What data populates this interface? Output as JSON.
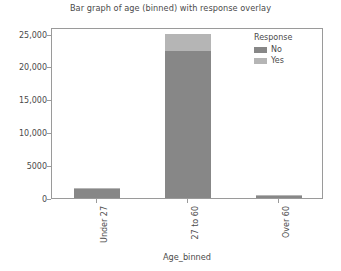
{
  "chart_data": {
    "type": "bar",
    "title": "Bar graph of age (binned) with response overlay",
    "xlabel": "Age_binned",
    "ylabel": "",
    "categories": [
      "Under 27",
      "27 to 60",
      "Over 60"
    ],
    "series": [
      {
        "name": "No",
        "color": "#878787",
        "values": [
          1400,
          22400,
          450
        ]
      },
      {
        "name": "Yes",
        "color": "#b5b5b5",
        "values": [
          150,
          2600,
          50
        ]
      }
    ],
    "stacked": true,
    "totals": [
      1550,
      25000,
      500
    ],
    "ylim": [
      0,
      26000
    ],
    "yticks": [
      0,
      5000,
      10000,
      15000,
      20000,
      25000
    ],
    "ytick_labels": [
      "0",
      "5000",
      "10,000",
      "15,000",
      "20,000",
      "25,000"
    ],
    "grid": false,
    "legend": {
      "title": "Response",
      "position": "top-right",
      "entries": [
        {
          "label": "No",
          "color": "#878787"
        },
        {
          "label": "Yes",
          "color": "#b5b5b5"
        }
      ]
    },
    "xtick_label_rotation": 90,
    "frame_color": "#9a9a9a",
    "background": "#ffffff"
  }
}
